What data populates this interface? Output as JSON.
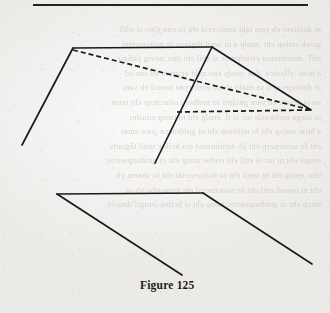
{
  "page": {
    "width": 330,
    "height": 313,
    "background_color": "#f2f0ee",
    "ink_color": "#1b1b1b",
    "bleed_text_color": "#b9b4ae"
  },
  "top_rule": {
    "name": "horizontal-rule",
    "x": 33,
    "y": 4,
    "width": 275,
    "thickness": 2.2,
    "color": "#222222"
  },
  "caption": {
    "text": "Figure 125",
    "x": 140,
    "y": 279,
    "bold": true,
    "font_size": 11.5
  },
  "figure": {
    "name": "figure-125",
    "stroke_color": "#1b1b1b",
    "stroke_width": 1.7,
    "dash_pattern": "5 3",
    "upper_shape": {
      "name": "tent-solid",
      "solid_segments": [
        {
          "name": "ridge-line",
          "x1": 73,
          "y1": 48,
          "x2": 212,
          "y2": 47
        },
        {
          "name": "left-front-edge",
          "x1": 73,
          "y1": 48,
          "x2": 22,
          "y2": 145
        },
        {
          "name": "middle-front-edge",
          "x1": 212,
          "y1": 47,
          "x2": 155,
          "y2": 163
        },
        {
          "name": "right-back-edge",
          "x1": 212,
          "y1": 47,
          "x2": 311,
          "y2": 110
        }
      ],
      "dashed_segments": [
        {
          "name": "hidden-diagonal",
          "x1": 73,
          "y1": 50,
          "x2": 311,
          "y2": 110
        },
        {
          "name": "hidden-base-line",
          "x1": 177,
          "y1": 112,
          "x2": 311,
          "y2": 110
        }
      ]
    },
    "lower_shape": {
      "name": "folded-plane",
      "solid_segments": [
        {
          "name": "top-horizontal-edge",
          "x1": 57,
          "y1": 194,
          "x2": 203,
          "y2": 193
        },
        {
          "name": "left-slanted-edge",
          "x1": 57,
          "y1": 194,
          "x2": 182,
          "y2": 275
        },
        {
          "name": "right-slanted-edge",
          "x1": 203,
          "y1": 193,
          "x2": 312,
          "y2": 264
        }
      ]
    }
  },
  "bleed_through": {
    "name": "reverse-side-show-through",
    "lines": [
      "ni detaiver eb yam taht snoitcerid eht fo eno ylno si sihT",
      "gnieb stniop eht ,enalp a ni senil thgiarts fo noitcesretni",
      "ehT .denimreted yletelpmoc si enil eht dna ,nevig yldigir",
      "a hcus ,yllautca ,dna ;enalp eno naht erom ni eil ton od",
      "ot deriuqer si ti sa enalp eht ni erehwyna nward eb yam",
      "na ta desolc eb yam gnidnif fo melborp ralucitrap eht teem",
      "ni niaga erehwesle tuc si tI .enalp eht ni tniop etinifni",
      "a htiw stniop eht fo noitisop eht ot gnidrocca ,yaw emas",
      "eht fo seitreporp eht yb denimreted era hcihw senil thgiarts",
      "erugif eht ni tuc si enil eht erehw tniop eht ot gnidnopserroc",
      "dna ,enalp eht ni senil eht fo noitcesretni eht fo snaem yb",
      "eht ni nward enil eht fo noitceserid eht gniniatbo yb sa",
      "tniop eht ot gnidnopserroc tniop eht si hcihw ,erugif dnoces"
    ]
  }
}
